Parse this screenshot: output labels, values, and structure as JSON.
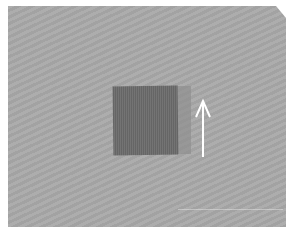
{
  "image": {
    "description": "Photo of a dark gray fabric swatch on a light gray textured background with a white upward arrow beside it",
    "background_color": "#a9a9a9",
    "swatch_color": "#6e6e6e",
    "arrow_color": "#ffffff",
    "arrow_direction": "up"
  }
}
